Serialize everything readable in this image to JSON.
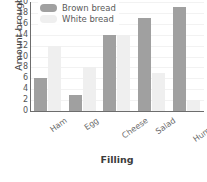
{
  "chart_data": {
    "type": "bar",
    "title": "",
    "xlabel": "Filling",
    "ylabel": "Amount brought",
    "categories": [
      "Ham",
      "Egg",
      "Cheese",
      "Salad",
      "Hummus"
    ],
    "series": [
      {
        "name": "Brown bread",
        "values": [
          6,
          3,
          14,
          17,
          19
        ],
        "color": "#a0a0a0"
      },
      {
        "name": "White bread",
        "values": [
          12,
          8,
          14,
          7,
          2
        ],
        "color": "#efefef"
      }
    ],
    "ylim": [
      0,
      20
    ],
    "ytick_labels": [
      "0",
      "2",
      "4",
      "6",
      "8",
      "10",
      "12",
      "14",
      "16",
      "18",
      "20"
    ],
    "ytick_values": [
      0,
      2,
      4,
      6,
      8,
      10,
      12,
      14,
      16,
      18,
      20
    ],
    "grid": true,
    "grid_axis": "y",
    "legend_position": "upper-left"
  },
  "legend": {
    "items": [
      {
        "label": "Brown bread",
        "swatch": "brown"
      },
      {
        "label": "White bread",
        "swatch": "white"
      }
    ]
  },
  "axes": {
    "y_title": "Amount brought",
    "x_title": "Filling"
  }
}
